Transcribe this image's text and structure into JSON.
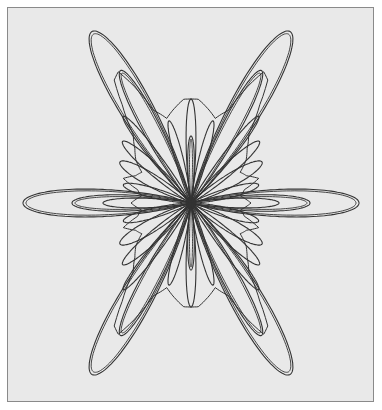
{
  "figure": {
    "title": "",
    "background": "#e9e9e9",
    "border_color": "#8a8a8a",
    "stroke_color": "#333333",
    "center": [
      183,
      195
    ]
  },
  "petals": [
    {
      "angle": -60,
      "length": 198,
      "width": 20,
      "double": true
    },
    {
      "angle": -120,
      "length": 198,
      "width": 20,
      "double": true
    },
    {
      "angle": 60,
      "length": 198,
      "width": 20,
      "double": true
    },
    {
      "angle": 120,
      "length": 198,
      "width": 20,
      "double": true
    },
    {
      "angle": 0,
      "length": 168,
      "width": 17,
      "double": true
    },
    {
      "angle": 180,
      "length": 168,
      "width": 17,
      "double": true
    },
    {
      "angle": 0,
      "length": 119,
      "width": 10,
      "double": true
    },
    {
      "angle": 180,
      "length": 119,
      "width": 10,
      "double": true
    },
    {
      "angle": 0,
      "length": 88,
      "width": 6,
      "double": false
    },
    {
      "angle": 180,
      "length": 88,
      "width": 6,
      "double": false
    },
    {
      "angle": -62,
      "length": 150,
      "width": 11,
      "double": true
    },
    {
      "angle": -118,
      "length": 150,
      "width": 11,
      "double": true
    },
    {
      "angle": 62,
      "length": 150,
      "width": 11,
      "double": true
    },
    {
      "angle": 118,
      "length": 150,
      "width": 11,
      "double": true
    },
    {
      "angle": -90,
      "length": 104,
      "width": 6,
      "double": false
    },
    {
      "angle": 90,
      "length": 104,
      "width": 6,
      "double": false
    },
    {
      "angle": -90,
      "length": 67,
      "width": 4,
      "double": true
    },
    {
      "angle": 90,
      "length": 67,
      "width": 4,
      "double": true
    },
    {
      "angle": -30,
      "length": 82,
      "width": 8,
      "double": false
    },
    {
      "angle": -150,
      "length": 82,
      "width": 8,
      "double": false
    },
    {
      "angle": 30,
      "length": 82,
      "width": 8,
      "double": false
    },
    {
      "angle": 150,
      "length": 82,
      "width": 8,
      "double": false
    },
    {
      "angle": -42,
      "length": 92,
      "width": 7,
      "double": false
    },
    {
      "angle": -138,
      "length": 92,
      "width": 7,
      "double": false
    },
    {
      "angle": 42,
      "length": 92,
      "width": 7,
      "double": false
    },
    {
      "angle": 138,
      "length": 92,
      "width": 7,
      "double": false
    },
    {
      "angle": -15,
      "length": 70,
      "width": 6,
      "double": false
    },
    {
      "angle": -165,
      "length": 70,
      "width": 6,
      "double": false
    },
    {
      "angle": 15,
      "length": 70,
      "width": 6,
      "double": false
    },
    {
      "angle": 165,
      "length": 70,
      "width": 6,
      "double": false
    },
    {
      "angle": -75,
      "length": 85,
      "width": 5,
      "double": false
    },
    {
      "angle": -105,
      "length": 85,
      "width": 5,
      "double": false
    },
    {
      "angle": 75,
      "length": 85,
      "width": 5,
      "double": false
    },
    {
      "angle": 105,
      "length": 85,
      "width": 5,
      "double": false
    },
    {
      "angle": -52,
      "length": 110,
      "width": 6,
      "double": false
    },
    {
      "angle": -128,
      "length": 110,
      "width": 6,
      "double": false
    },
    {
      "angle": 52,
      "length": 110,
      "width": 6,
      "double": false
    },
    {
      "angle": 128,
      "length": 110,
      "width": 6,
      "double": false
    }
  ],
  "envelope": {
    "radii_by_angle_deg": [
      [
        0,
        60
      ],
      [
        8,
        50
      ],
      [
        14,
        55
      ],
      [
        20,
        72
      ],
      [
        26,
        62
      ],
      [
        32,
        58
      ],
      [
        38,
        70
      ],
      [
        44,
        78
      ],
      [
        50,
        90
      ],
      [
        55,
        120
      ],
      [
        58,
        145
      ],
      [
        61,
        150
      ],
      [
        64,
        130
      ],
      [
        68,
        100
      ],
      [
        74,
        88
      ],
      [
        80,
        96
      ],
      [
        86,
        104
      ],
      [
        90,
        104
      ]
    ]
  }
}
